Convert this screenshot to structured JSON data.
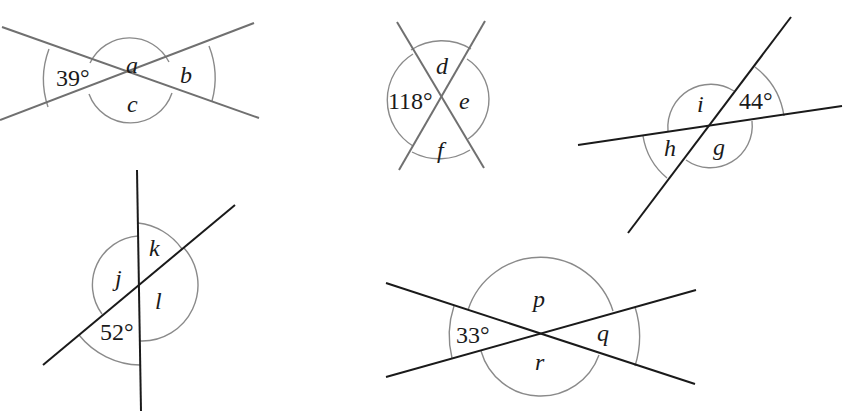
{
  "diagrams": [
    {
      "id": "d1",
      "center": [
        131,
        78
      ],
      "lines": [
        [
          2,
          27,
          259,
          118
        ],
        [
          0,
          120,
          254,
          23
        ]
      ],
      "labels": {
        "given": "39°",
        "v1": "a",
        "v2": "b",
        "v3": "c"
      },
      "given_angle": 39
    },
    {
      "id": "d2",
      "center": [
        441,
        100
      ],
      "lines": [
        [
          397,
          22,
          484,
          168
        ],
        [
          485,
          21,
          399,
          170
        ]
      ],
      "labels": {
        "given": "118°",
        "v1": "d",
        "v2": "e",
        "v3": "f"
      },
      "given_angle": 118
    },
    {
      "id": "d3",
      "center": [
        710,
        127
      ],
      "lines": [
        [
          578,
          145,
          842,
          106
        ],
        [
          628,
          233,
          791,
          17
        ]
      ],
      "labels": {
        "given": "44°",
        "v1": "i",
        "v2": "h",
        "v3": "g"
      },
      "given_angle": 44
    },
    {
      "id": "d4",
      "center": [
        140,
        285
      ],
      "lines": [
        [
          137,
          170,
          141,
          411
        ],
        [
          43,
          365,
          235,
          205
        ]
      ],
      "labels": {
        "given": "52°",
        "v1": "k",
        "v2": "j",
        "v3": "l"
      },
      "given_angle": 52
    },
    {
      "id": "d5",
      "center": [
        540,
        333
      ],
      "lines": [
        [
          386,
          283,
          695,
          384
        ],
        [
          386,
          377,
          696,
          290
        ]
      ],
      "labels": {
        "given": "33°",
        "v1": "p",
        "v2": "q",
        "v3": "r"
      },
      "given_angle": 33
    }
  ]
}
